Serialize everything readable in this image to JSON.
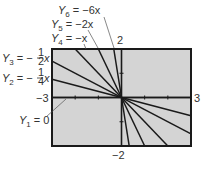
{
  "chart_data": {
    "type": "line",
    "title": "",
    "xlabel": "",
    "ylabel": "",
    "xlim": [
      -3,
      3
    ],
    "ylim": [
      -2,
      2
    ],
    "grid": false,
    "tick_labels": {
      "x_min": "−3",
      "x_max": "3",
      "y_min": "−2",
      "y_max": "2"
    },
    "series": [
      {
        "name": "Y1 = 0",
        "slope": 0
      },
      {
        "name": "Y2 = −1/4 x",
        "slope": -0.25
      },
      {
        "name": "Y3 = −1/2 x",
        "slope": -0.5
      },
      {
        "name": "Y4 = −x",
        "slope": -1
      },
      {
        "name": "Y5 = −2x",
        "slope": -2
      },
      {
        "name": "Y6 = −6x",
        "slope": -6
      }
    ]
  },
  "labels": {
    "y6": {
      "var": "Y",
      "sub": "6",
      "rhs": " = −6x"
    },
    "y5": {
      "var": "Y",
      "sub": "5",
      "rhs": " = −2x"
    },
    "y4": {
      "var": "Y",
      "sub": "4",
      "rhs": " = −x"
    },
    "y3": {
      "var": "Y",
      "sub": "3",
      "rhs_prefix": " = −",
      "num": "1",
      "den": "2",
      "rhs_suffix": "x"
    },
    "y2": {
      "var": "Y",
      "sub": "2",
      "rhs_prefix": " = −",
      "num": "1",
      "den": "4",
      "rhs_suffix": "x"
    },
    "y1": {
      "var": "Y",
      "sub": "1",
      "rhs": " = 0"
    },
    "x_min": "−3",
    "x_max": "3",
    "y_min": "−2",
    "y_max": "2"
  },
  "colors": {
    "plot_background": "#d4d4d4",
    "frame": "#1a1a1a",
    "lines": "#1a1a1a",
    "text": "#333333"
  }
}
